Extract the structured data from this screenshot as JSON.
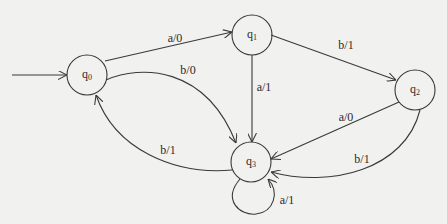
{
  "diagram": {
    "type": "finite-state-machine (Mealy)",
    "colors": {
      "background": "#f1f1f0",
      "stroke": "#3a3a3a",
      "text": "#2b2b2b"
    },
    "initial_state": "q0",
    "states": [
      {
        "id": "q0",
        "base": "q",
        "sub": "0",
        "cx": 87,
        "cy": 75,
        "r": 20
      },
      {
        "id": "q1",
        "base": "q",
        "sub": "1",
        "cx": 252,
        "cy": 35,
        "r": 20
      },
      {
        "id": "q2",
        "base": "q",
        "sub": "2",
        "cx": 415,
        "cy": 90,
        "r": 20
      },
      {
        "id": "q3",
        "base": "q",
        "sub": "3",
        "cx": 251,
        "cy": 162,
        "r": 20
      }
    ],
    "transitions": [
      {
        "from": "q0",
        "to": "q1",
        "label": "a/0",
        "lx": 175,
        "ly": 38
      },
      {
        "from": "q0",
        "to": "q3",
        "label": "b/0",
        "lx": 188,
        "ly": 70
      },
      {
        "from": "q1",
        "to": "q3",
        "label": "a/1",
        "lx": 264,
        "ly": 87
      },
      {
        "from": "q1",
        "to": "q2",
        "label": "b/1",
        "lx": 346,
        "ly": 45
      },
      {
        "from": "q2",
        "to": "q3",
        "label": "a/0",
        "lx": 346,
        "ly": 117
      },
      {
        "from": "q2",
        "to": "q3",
        "label": "b/1",
        "lx": 362,
        "ly": 159
      },
      {
        "from": "q3",
        "to": "q0",
        "label": "b/1",
        "lx": 168,
        "ly": 150
      },
      {
        "from": "q3",
        "to": "q3",
        "label": "a/1",
        "lx": 287,
        "ly": 200
      }
    ]
  }
}
